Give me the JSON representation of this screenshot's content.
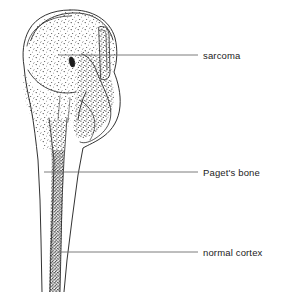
{
  "figure": {
    "background_color": "#ffffff",
    "ink_color": "#1b1b1b",
    "leader_color": "#6e6e6e"
  },
  "labels": [
    {
      "id": "sarcoma",
      "text": "sarcoma",
      "leader": {
        "x1": 58,
        "y1": 55,
        "x2": 198,
        "y2": 55
      },
      "text_position": {
        "x": 203,
        "y": 50
      }
    },
    {
      "id": "pagets-bone",
      "text": "Paget's bone",
      "leader": {
        "x1": 44,
        "y1": 172,
        "x2": 198,
        "y2": 172
      },
      "text_position": {
        "x": 203,
        "y": 167
      }
    },
    {
      "id": "normal-cortex",
      "text": "normal cortex",
      "leader": {
        "x1": 58,
        "y1": 252,
        "x2": 198,
        "y2": 252
      },
      "text_position": {
        "x": 203,
        "y": 247
      }
    }
  ],
  "anatomy": {
    "regions": [
      {
        "name": "femoral-head",
        "description": "rounded proximal epiphysis with articular outline"
      },
      {
        "name": "sarcoma-mass",
        "description": "irregular stippled tumour mass breaching lateral cortex"
      },
      {
        "name": "pagetic-medulla",
        "description": "dense coarse stippling filling the medullary canal"
      },
      {
        "name": "normal-cortex",
        "description": "thin parallel cortical lines of the distal shaft"
      }
    ]
  }
}
